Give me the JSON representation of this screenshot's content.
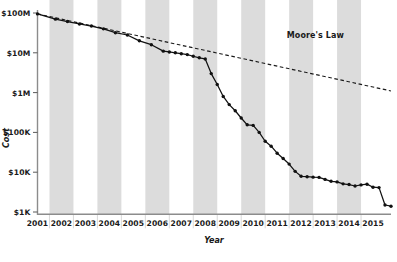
{
  "chart_data": {
    "type": "line",
    "title": "",
    "xlabel": "Year",
    "ylabel": "Cost",
    "yscale": "log",
    "ylim": [
      1000,
      100000000
    ],
    "xlim": [
      2001,
      2015.75
    ],
    "grid": false,
    "legend_position": "inline-annotation",
    "ytick_labels": [
      "$100M",
      "$10M",
      "$1M",
      "$100K",
      "$10K",
      "$1K"
    ],
    "ytick_values": [
      100000000,
      10000000,
      1000000,
      100000,
      10000,
      1000
    ],
    "xtick_labels": [
      "2001",
      "2002",
      "2003",
      "2004",
      "2005",
      "2006",
      "2007",
      "2008",
      "2009",
      "2010",
      "2011",
      "2012",
      "2013",
      "2014",
      "2015"
    ],
    "xtick_values": [
      2001,
      2002,
      2003,
      2004,
      2005,
      2006,
      2007,
      2008,
      2009,
      2010,
      2011,
      2012,
      2013,
      2014,
      2015
    ],
    "banded_years": [
      "2002",
      "2004",
      "2006",
      "2008",
      "2010",
      "2012",
      "2014"
    ],
    "band_color": "#dcdcdc",
    "series": [
      {
        "name": "Cost per Genome",
        "style": "solid-with-markers",
        "color": "#111111",
        "points": [
          {
            "x": 2001.0,
            "y": 95000000
          },
          {
            "x": 2001.75,
            "y": 70000000
          },
          {
            "x": 2002.25,
            "y": 61000000
          },
          {
            "x": 2002.75,
            "y": 53000000
          },
          {
            "x": 2003.25,
            "y": 47000000
          },
          {
            "x": 2003.75,
            "y": 40000000
          },
          {
            "x": 2004.25,
            "y": 32000000
          },
          {
            "x": 2004.75,
            "y": 28000000
          },
          {
            "x": 2005.25,
            "y": 20000000
          },
          {
            "x": 2005.75,
            "y": 16000000
          },
          {
            "x": 2006.25,
            "y": 11000000
          },
          {
            "x": 2006.5,
            "y": 10500000
          },
          {
            "x": 2006.75,
            "y": 10000000
          },
          {
            "x": 2007.0,
            "y": 9500000
          },
          {
            "x": 2007.25,
            "y": 9000000
          },
          {
            "x": 2007.5,
            "y": 8200000
          },
          {
            "x": 2007.75,
            "y": 7500000
          },
          {
            "x": 2008.0,
            "y": 7000000
          },
          {
            "x": 2008.25,
            "y": 3000000
          },
          {
            "x": 2008.5,
            "y": 1600000
          },
          {
            "x": 2008.75,
            "y": 800000
          },
          {
            "x": 2009.0,
            "y": 500000
          },
          {
            "x": 2009.25,
            "y": 350000
          },
          {
            "x": 2009.5,
            "y": 230000
          },
          {
            "x": 2009.75,
            "y": 155000
          },
          {
            "x": 2010.0,
            "y": 150000
          },
          {
            "x": 2010.25,
            "y": 100000
          },
          {
            "x": 2010.5,
            "y": 60000
          },
          {
            "x": 2010.75,
            "y": 45000
          },
          {
            "x": 2011.0,
            "y": 30000
          },
          {
            "x": 2011.25,
            "y": 22000
          },
          {
            "x": 2011.5,
            "y": 16000
          },
          {
            "x": 2011.75,
            "y": 10500
          },
          {
            "x": 2012.0,
            "y": 7900
          },
          {
            "x": 2012.25,
            "y": 7700
          },
          {
            "x": 2012.5,
            "y": 7500
          },
          {
            "x": 2012.75,
            "y": 7400
          },
          {
            "x": 2013.0,
            "y": 6600
          },
          {
            "x": 2013.25,
            "y": 5900
          },
          {
            "x": 2013.5,
            "y": 5700
          },
          {
            "x": 2013.75,
            "y": 5100
          },
          {
            "x": 2014.0,
            "y": 4900
          },
          {
            "x": 2014.25,
            "y": 4500
          },
          {
            "x": 2014.5,
            "y": 4800
          },
          {
            "x": 2014.75,
            "y": 5000
          },
          {
            "x": 2015.0,
            "y": 4200
          },
          {
            "x": 2015.25,
            "y": 4100
          },
          {
            "x": 2015.5,
            "y": 1500
          },
          {
            "x": 2015.75,
            "y": 1400
          }
        ]
      },
      {
        "name": "Moore's Law",
        "style": "dashed",
        "color": "#1a1a1a",
        "annotation": "Moore's Law",
        "points": [
          {
            "x": 2001.0,
            "y": 95000000
          },
          {
            "x": 2015.75,
            "y": 1100000
          }
        ]
      }
    ],
    "annotations": [
      {
        "text": "Moore's Law",
        "x": 2011.4,
        "y": 24000000
      }
    ]
  }
}
